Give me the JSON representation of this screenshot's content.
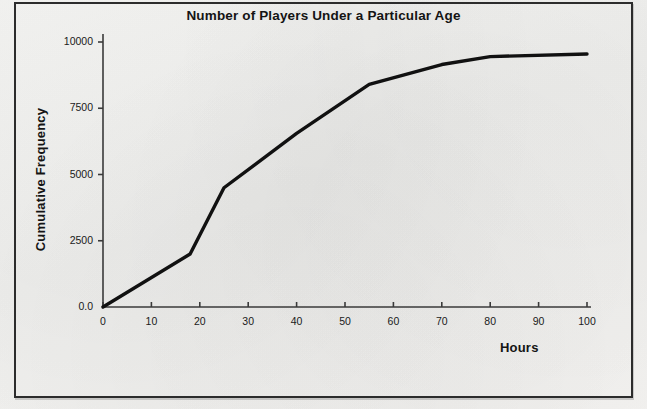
{
  "figure": {
    "border_color": "#2c2c2c",
    "background_color": "#f2f2f0"
  },
  "chart_data": {
    "type": "line",
    "title": "Number of Players Under a Particular Age",
    "xlabel": "Hours",
    "ylabel": "Cumulative Frequency",
    "xlim": [
      0,
      100
    ],
    "ylim": [
      0,
      10000
    ],
    "grid": false,
    "legend": null,
    "line_color": "#111111",
    "line_width": 3.4,
    "xticks": [
      0,
      10,
      20,
      30,
      40,
      50,
      60,
      70,
      80,
      90,
      100
    ],
    "xtick_labels": [
      "0",
      "10",
      "20",
      "30",
      "40",
      "50",
      "60",
      "70",
      "80",
      "90",
      "100"
    ],
    "yticks": [
      0,
      2500,
      5000,
      7500,
      10000
    ],
    "ytick_labels": [
      "0.0",
      "2500",
      "5000",
      "7500",
      "10000"
    ],
    "x": [
      0,
      18,
      25,
      40,
      55,
      70,
      80,
      100
    ],
    "values": [
      0,
      2000,
      4500,
      6550,
      8400,
      9150,
      9450,
      9550
    ],
    "points": [
      {
        "x": 0,
        "y": 0
      },
      {
        "x": 18,
        "y": 2000
      },
      {
        "x": 25,
        "y": 4500
      },
      {
        "x": 40,
        "y": 6550
      },
      {
        "x": 55,
        "y": 8400
      },
      {
        "x": 70,
        "y": 9150
      },
      {
        "x": 80,
        "y": 9450
      },
      {
        "x": 100,
        "y": 9550
      }
    ]
  }
}
